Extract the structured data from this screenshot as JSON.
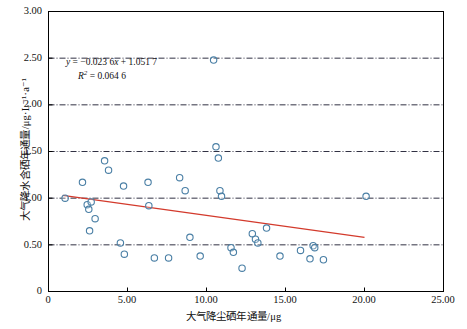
{
  "chart_data": {
    "type": "scatter",
    "title": "",
    "xlabel": "大气降尘硒年通量/μg",
    "ylabel": "大气降水含硒年通量/μg·L⁻¹·a⁻¹",
    "xlim": [
      0,
      25.0
    ],
    "ylim": [
      0,
      3.0
    ],
    "xticks": [
      "0",
      "5.00",
      "10.00",
      "15.00",
      "20.00",
      "25.00"
    ],
    "xtick_values": [
      0,
      5.0,
      10.0,
      15.0,
      20.0,
      25.0
    ],
    "yticks": [
      "0",
      "0.50",
      "1.00",
      "1.50",
      "2.00",
      "2.50",
      "3.00"
    ],
    "ytick_values": [
      0,
      0.5,
      1.0,
      1.5,
      2.0,
      2.5,
      3.0
    ],
    "grid": "horizontal-dashdot",
    "grid_color": "#1a1a2e",
    "legend": "none",
    "marker": "open-circle",
    "marker_color": "#4a7fa5",
    "points": [
      [
        1.05,
        1.0
      ],
      [
        2.15,
        1.17
      ],
      [
        2.45,
        0.93
      ],
      [
        2.55,
        0.88
      ],
      [
        2.7,
        0.96
      ],
      [
        2.95,
        0.78
      ],
      [
        2.6,
        0.65
      ],
      [
        3.55,
        1.4
      ],
      [
        3.8,
        1.3
      ],
      [
        4.75,
        1.13
      ],
      [
        4.55,
        0.52
      ],
      [
        4.8,
        0.4
      ],
      [
        6.3,
        1.17
      ],
      [
        6.35,
        0.92
      ],
      [
        6.7,
        0.36
      ],
      [
        7.6,
        0.36
      ],
      [
        8.3,
        1.22
      ],
      [
        8.65,
        1.08
      ],
      [
        8.95,
        0.58
      ],
      [
        9.6,
        0.38
      ],
      [
        10.45,
        2.48
      ],
      [
        10.6,
        1.55
      ],
      [
        10.75,
        1.43
      ],
      [
        10.85,
        1.08
      ],
      [
        10.95,
        1.02
      ],
      [
        11.55,
        0.47
      ],
      [
        11.7,
        0.42
      ],
      [
        12.25,
        0.25
      ],
      [
        12.9,
        0.62
      ],
      [
        13.1,
        0.56
      ],
      [
        13.25,
        0.52
      ],
      [
        13.8,
        0.68
      ],
      [
        14.65,
        0.38
      ],
      [
        15.95,
        0.44
      ],
      [
        16.55,
        0.35
      ],
      [
        16.75,
        0.49
      ],
      [
        16.85,
        0.47
      ],
      [
        17.4,
        0.34
      ],
      [
        20.1,
        1.02
      ]
    ],
    "trendline": {
      "equation_text": "y = −0.023 6x + 1.051 7",
      "r2_text": "R² = 0.064 6",
      "slope": -0.0236,
      "intercept": 1.0517,
      "r_squared": 0.0646,
      "color": "#d33a2c",
      "x_start": 0.9,
      "x_end": 20.0
    },
    "annotations": {
      "equation_y_label": "y",
      "equation_eq": " = −0.023 6",
      "equation_x": "x",
      "equation_tail": " + 1.051 7",
      "r2_symbol": "R",
      "r2_exp": "2",
      "r2_value": " = 0.064 6"
    }
  },
  "axes": {
    "x_title": "大气降尘硒年通量/μg",
    "y_title": "大气降水含硒年通量/μg·L⁻¹·a⁻¹"
  }
}
